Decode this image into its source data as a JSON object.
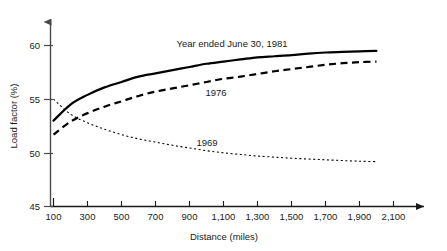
{
  "chart_data": {
    "type": "line",
    "title": "",
    "xlabel": "Distance (miles)",
    "ylabel": "Load factor (%)",
    "xlim": [
      100,
      2100
    ],
    "ylim": [
      45,
      60
    ],
    "grid": false,
    "legend_position": "inline-annotations",
    "xticks": [
      100,
      300,
      500,
      700,
      900,
      1100,
      1300,
      1500,
      1700,
      1900,
      2100
    ],
    "xtick_labels": [
      "100",
      "300",
      "500",
      "700",
      "900",
      "1,100",
      "1,300",
      "1,500",
      "1,700",
      "1,900",
      "2,100"
    ],
    "yticks": [
      45,
      50,
      55,
      60
    ],
    "ytick_labels": [
      "45",
      "50",
      "55",
      "60"
    ],
    "x": [
      100,
      200,
      300,
      400,
      500,
      600,
      700,
      800,
      900,
      1000,
      1100,
      1200,
      1300,
      1400,
      1500,
      1600,
      1700,
      1800,
      1900,
      2000
    ],
    "series": [
      {
        "name": "Year ended June 30, 1981",
        "style": "solid",
        "color": "#000000",
        "values": [
          53.0,
          54.5,
          55.4,
          56.1,
          56.6,
          57.1,
          57.4,
          57.7,
          58.0,
          58.3,
          58.5,
          58.7,
          58.9,
          59.0,
          59.1,
          59.25,
          59.35,
          59.4,
          59.45,
          59.5
        ]
      },
      {
        "name": "1976",
        "style": "dashed",
        "color": "#000000",
        "values": [
          51.7,
          52.9,
          53.7,
          54.3,
          54.8,
          55.3,
          55.7,
          56.0,
          56.3,
          56.6,
          56.9,
          57.1,
          57.35,
          57.6,
          57.8,
          58.0,
          58.2,
          58.35,
          58.45,
          58.5
        ]
      },
      {
        "name": "1969",
        "style": "dotted",
        "color": "#000000",
        "values": [
          55.0,
          53.6,
          52.8,
          52.2,
          51.7,
          51.3,
          51.0,
          50.7,
          50.45,
          50.2,
          50.0,
          49.85,
          49.7,
          49.6,
          49.5,
          49.42,
          49.35,
          49.28,
          49.22,
          49.18
        ]
      }
    ],
    "annotations": [
      {
        "text": "Year ended June 30, 1981",
        "x": 232,
        "y": 47,
        "anchor": "middle"
      },
      {
        "text": "1976",
        "x": 216,
        "y": 96,
        "anchor": "middle"
      },
      {
        "text": "1969",
        "x": 207,
        "y": 146,
        "anchor": "middle"
      }
    ]
  }
}
